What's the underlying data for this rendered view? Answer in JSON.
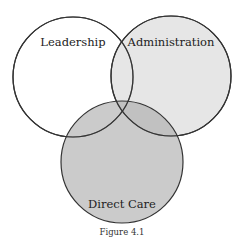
{
  "diagram": {
    "type": "venn",
    "sets": [
      {
        "id": "leadership",
        "label": "Leadership",
        "cx": 73,
        "cy": 77,
        "r": 60,
        "fill": "#ffffff",
        "fill_opacity": 0.0
      },
      {
        "id": "administration",
        "label": "Administration",
        "cx": 171,
        "cy": 76,
        "r": 60,
        "fill": "#c8c8c8",
        "fill_opacity": 0.45
      },
      {
        "id": "direct_care",
        "label": "Direct Care",
        "cx": 122,
        "cy": 162,
        "r": 61,
        "fill": "#a8a8a8",
        "fill_opacity": 0.6
      }
    ],
    "stroke_color": "#333333",
    "caption": "Figure 4.1"
  },
  "colors": {
    "background": "#ffffff",
    "outline": "#333333",
    "text": "#222222"
  }
}
